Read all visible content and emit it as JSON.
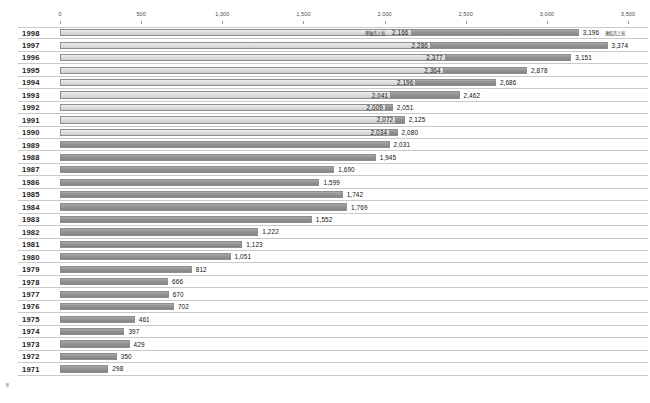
{
  "chart_data": {
    "type": "bar",
    "orientation": "horizontal",
    "title": "",
    "xlabel": "",
    "ylabel": "",
    "xlim": [
      0,
      3500
    ],
    "grid": false,
    "legend_position": "inline-annotation",
    "axis_ticks": [
      "0",
      "500",
      "1,000",
      "1,500",
      "2,000",
      "2,500",
      "3,000",
      "3,500"
    ],
    "axis_tick_values": [
      0,
      500,
      1000,
      1500,
      2000,
      2500,
      3000,
      3500
    ],
    "categories": [
      "1998",
      "1997",
      "1996",
      "1995",
      "1994",
      "1993",
      "1992",
      "1991",
      "1990",
      "1989",
      "1988",
      "1987",
      "1986",
      "1985",
      "1984",
      "1983",
      "1982",
      "1981",
      "1980",
      "1979",
      "1978",
      "1977",
      "1976",
      "1975",
      "1974",
      "1973",
      "1972",
      "1971"
    ],
    "series": [
      {
        "name": "単独売上高",
        "key": "standalone",
        "color": "#dedede",
        "values": [
          2166,
          2286,
          2377,
          2364,
          2196,
          2041,
          2009,
          2072,
          2034,
          2031,
          1945,
          1690,
          1599,
          1742,
          1769,
          1552,
          1222,
          1123,
          1051,
          812,
          666,
          670,
          702,
          461,
          397,
          429,
          350,
          298
        ],
        "labels": [
          "2,166",
          "2,286",
          "2,377",
          "2,364",
          "2,196",
          "2,041",
          "2,009",
          "2,072",
          "2,034",
          "2,031",
          "1,945",
          "1,690",
          "1,599",
          "1,742",
          "1,769",
          "1,552",
          "1,222",
          "1,123",
          "1,051",
          "812",
          "666",
          "670",
          "702",
          "461",
          "397",
          "429",
          "350",
          "298"
        ]
      },
      {
        "name": "連結売上高",
        "key": "consolidated",
        "color": "#949494",
        "values": [
          3196,
          3374,
          3151,
          2878,
          2686,
          2462,
          2051,
          2125,
          2080,
          null,
          null,
          null,
          null,
          null,
          null,
          null,
          null,
          null,
          null,
          null,
          null,
          null,
          null,
          null,
          null,
          null,
          null,
          null
        ],
        "labels": [
          "3,196",
          "3,374",
          "3,151",
          "2,878",
          "2,686",
          "2,462",
          "2,051",
          "2,125",
          "2,080",
          "",
          "",
          "",
          "",
          "",
          "",
          "",
          "",
          "",
          "",
          "",
          "",
          "",
          "",
          "",
          "",
          "",
          "",
          ""
        ]
      }
    ],
    "annotations": {
      "standalone_tag": "単独売上高",
      "consolidated_tag": "連結売上高",
      "corner_mark": "8"
    }
  }
}
